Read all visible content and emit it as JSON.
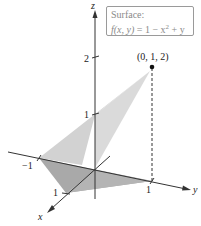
{
  "figure": {
    "legend": {
      "title": "Surface:",
      "function_lhs": "f(x, y)",
      "function_rhs": "= 1 − x",
      "exponent": "2",
      "function_tail": " + y"
    },
    "axes": {
      "x_label": "x",
      "y_label": "y",
      "z_label": "z",
      "z_ticks": [
        "1",
        "2"
      ],
      "y_ticks": [
        "−1",
        "1"
      ],
      "x_ticks": [
        "1"
      ]
    },
    "point": {
      "label": "(0, 1, 2)",
      "coords": [
        0,
        1,
        2
      ]
    },
    "colors": {
      "surface_upper": "#cfcfcf",
      "surface_lower": "#a8a8a8",
      "axis": "#333333",
      "point": "#111111"
    }
  }
}
